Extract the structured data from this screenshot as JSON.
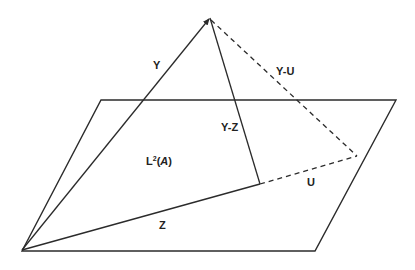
{
  "diagram": {
    "labels": {
      "y": "Y",
      "y_minus_u": "Y-U",
      "y_minus_z": "Y-Z",
      "plane_prefix": "L",
      "plane_sup": "2",
      "plane_open": "(",
      "plane_arg": "A",
      "plane_close": ")",
      "u": "U",
      "z": "Z"
    },
    "points": {
      "origin": [
        22,
        250
      ],
      "apex_y": [
        210,
        18
      ],
      "foot_z": [
        260,
        184
      ],
      "end_u": [
        357,
        156
      ]
    },
    "plane_corners": [
      [
        101,
        100
      ],
      [
        396,
        100
      ],
      [
        315,
        251
      ],
      [
        22,
        251
      ]
    ],
    "colors": {
      "stroke": "#2b2b2b",
      "text": "#222222",
      "background": "#ffffff"
    }
  }
}
